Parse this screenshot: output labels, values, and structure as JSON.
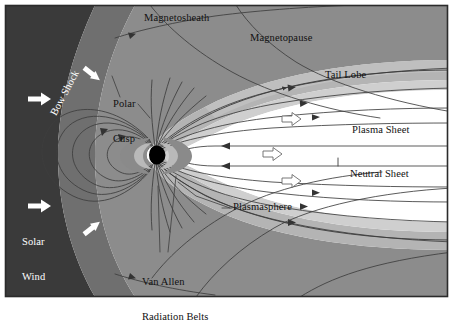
{
  "figure": {
    "type": "schematic-cross-section",
    "frame": {
      "border_color": "#2b2b2b",
      "background": "#ffffff"
    }
  },
  "colors": {
    "solar_wind": "#3a3a3a",
    "bow_shock_band": "#6f6f6f",
    "magnetosheath": "#8c8c8c",
    "magnetopause_band": "#b4b4b4",
    "outer_halo": "#cfcfcf",
    "interior": "#ffffff",
    "field_line": "#3d3d3d",
    "earth": "#000000",
    "radiation_belt": "#8a8a8a",
    "arrow_white": "#ffffff",
    "arrow_outline": "#555555",
    "text": "#111111"
  },
  "labels": [
    {
      "id": "bow-shock",
      "text": "Bow Shock",
      "x": 52,
      "y": 108,
      "rotated": true,
      "white": true,
      "lines": [
        "Bow Shock"
      ]
    },
    {
      "id": "solar-wind",
      "text": "Solar Wind",
      "x": 22,
      "y": 218,
      "rotated": false,
      "white": true,
      "lines": [
        "Solar",
        "Wind"
      ]
    },
    {
      "id": "magnetosheath",
      "text": "Magnetosheath",
      "x": 144,
      "y": 17,
      "rotated": false,
      "white": false,
      "lines": [
        "Magnetosheath"
      ]
    },
    {
      "id": "magnetopause",
      "text": "Magnetopause",
      "x": 250,
      "y": 36,
      "rotated": false,
      "white": false,
      "lines": [
        "Magnetopause"
      ]
    },
    {
      "id": "tail-lobe",
      "text": "Tail Lobe",
      "x": 325,
      "y": 73,
      "rotated": false,
      "white": false,
      "lines": [
        "Tail Lobe"
      ]
    },
    {
      "id": "plasma-sheet",
      "text": "Plasma Sheet",
      "x": 352,
      "y": 128,
      "rotated": false,
      "white": false,
      "lines": [
        "Plasma Sheet"
      ]
    },
    {
      "id": "neutral-sheet",
      "text": "Neutral Sheet",
      "x": 350,
      "y": 172,
      "rotated": false,
      "white": false,
      "lines": [
        "Neutral Sheet"
      ]
    },
    {
      "id": "polar-cusp",
      "text": "Polar Cusp",
      "x": 113,
      "y": 82,
      "rotated": false,
      "white": false,
      "lines": [
        "Polar",
        "Cusp"
      ]
    },
    {
      "id": "plasmasphere",
      "text": "Plasmasphere",
      "x": 233,
      "y": 205,
      "rotated": false,
      "white": false,
      "lines": [
        "Plasmasphere"
      ]
    },
    {
      "id": "van-allen",
      "text": "Van Allen Radiation Belts",
      "x": 142,
      "y": 258,
      "rotated": false,
      "white": false,
      "lines": [
        "Van Allen",
        "Radiation Belts"
      ]
    }
  ],
  "arrows": {
    "solar_wind_filled": [
      {
        "id": "sw-arrow-top",
        "x": 30,
        "y": 99,
        "angle": 0,
        "style": "filled-white"
      },
      {
        "id": "sw-arrow-bottom",
        "x": 30,
        "y": 206,
        "angle": 0,
        "style": "filled-white"
      },
      {
        "id": "sheath-arrow-top",
        "x": 88,
        "y": 74,
        "angle": 40,
        "style": "filled-white"
      },
      {
        "id": "sheath-arrow-bottom",
        "x": 88,
        "y": 228,
        "angle": -40,
        "style": "filled-white"
      }
    ],
    "tail_outlined": [
      {
        "id": "tail-arrow-1",
        "x": 291,
        "y": 120,
        "angle": 0,
        "style": "outlined"
      },
      {
        "id": "tail-arrow-2",
        "x": 272,
        "y": 155,
        "angle": 0,
        "style": "outlined"
      },
      {
        "id": "tail-arrow-3",
        "x": 291,
        "y": 182,
        "angle": 0,
        "style": "outlined"
      }
    ]
  },
  "regions": [
    {
      "id": "solar-wind-region",
      "name": "Solar Wind",
      "shade": "darkest"
    },
    {
      "id": "bow-shock-region",
      "name": "Bow Shock",
      "shade": "dark"
    },
    {
      "id": "magnetosheath-region",
      "name": "Magnetosheath",
      "shade": "medium"
    },
    {
      "id": "magnetopause-region",
      "name": "Magnetopause",
      "shade": "light"
    },
    {
      "id": "magnetosphere-interior",
      "name": "Magnetosphere Interior",
      "shade": "white"
    }
  ],
  "earth": {
    "cx": 156,
    "cy": 155,
    "r": 9.5,
    "lit_side": "left"
  },
  "radiation_belts": {
    "count": 2,
    "name": "Van Allen Radiation Belts"
  }
}
